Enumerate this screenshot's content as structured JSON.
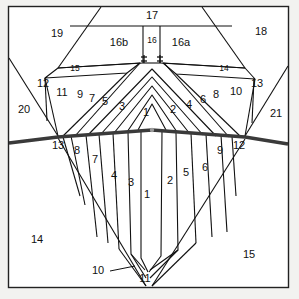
{
  "figure": {
    "type": "cross-section-diagram",
    "background_color": "#f2f2f0",
    "panel_fill": "#ffffff",
    "line_color": "#111111",
    "unconformity_color": "#3a3a3a",
    "frame": {
      "x": 8,
      "y": 6,
      "width": 281,
      "height": 282
    }
  },
  "labels": {
    "upper_fan": [
      {
        "id": "u1",
        "text": "1",
        "x": 146,
        "y": 113
      },
      {
        "id": "u2",
        "text": "2",
        "x": 173,
        "y": 110
      },
      {
        "id": "u3",
        "text": "3",
        "x": 122,
        "y": 107
      },
      {
        "id": "u4",
        "text": "4",
        "x": 189,
        "y": 105
      },
      {
        "id": "u5",
        "text": "5",
        "x": 105,
        "y": 102
      },
      {
        "id": "u6",
        "text": "6",
        "x": 203,
        "y": 100
      },
      {
        "id": "u7",
        "text": "7",
        "x": 92,
        "y": 99
      },
      {
        "id": "u8",
        "text": "8",
        "x": 216,
        "y": 95
      },
      {
        "id": "u9",
        "text": "9",
        "x": 80,
        "y": 95
      },
      {
        "id": "u10",
        "text": "10",
        "x": 236,
        "y": 92
      },
      {
        "id": "u11",
        "text": "11",
        "x": 62,
        "y": 93
      },
      {
        "id": "u12",
        "text": "12",
        "x": 43,
        "y": 84
      },
      {
        "id": "u13",
        "text": "13",
        "x": 257,
        "y": 84
      },
      {
        "id": "u14",
        "text": "14",
        "x": 224,
        "y": 69
      },
      {
        "id": "u15",
        "text": "15",
        "x": 75,
        "y": 69
      }
    ],
    "lower_fan": [
      {
        "id": "l1",
        "text": "1",
        "x": 147,
        "y": 195
      },
      {
        "id": "l2",
        "text": "2",
        "x": 170,
        "y": 181
      },
      {
        "id": "l3",
        "text": "3",
        "x": 131,
        "y": 183
      },
      {
        "id": "l4",
        "text": "4",
        "x": 114,
        "y": 176
      },
      {
        "id": "l5",
        "text": "5",
        "x": 186,
        "y": 173
      },
      {
        "id": "l6",
        "text": "6",
        "x": 205,
        "y": 168
      },
      {
        "id": "l7",
        "text": "7",
        "x": 95,
        "y": 160
      },
      {
        "id": "l8",
        "text": "8",
        "x": 77,
        "y": 151
      },
      {
        "id": "l9",
        "text": "9",
        "x": 220,
        "y": 151
      },
      {
        "id": "l10",
        "text": "10",
        "x": 98,
        "y": 271
      },
      {
        "id": "l11",
        "text": "11",
        "x": 145,
        "y": 279
      },
      {
        "id": "l12",
        "text": "12",
        "x": 239,
        "y": 146
      },
      {
        "id": "l13",
        "text": "13",
        "x": 58,
        "y": 146
      }
    ],
    "blocks": [
      {
        "id": "b14",
        "text": "14",
        "x": 37,
        "y": 240
      },
      {
        "id": "b15",
        "text": "15",
        "x": 249,
        "y": 255
      },
      {
        "id": "b16a",
        "text": "16a",
        "x": 181,
        "y": 43
      },
      {
        "id": "b16b",
        "text": "16b",
        "x": 119,
        "y": 43
      },
      {
        "id": "b16",
        "text": "16",
        "x": 152,
        "y": 41
      },
      {
        "id": "b17",
        "text": "17",
        "x": 152,
        "y": 16
      },
      {
        "id": "b18",
        "text": "18",
        "x": 261,
        "y": 32
      },
      {
        "id": "b19",
        "text": "19",
        "x": 57,
        "y": 34
      },
      {
        "id": "b20",
        "text": "20",
        "x": 24,
        "y": 110
      },
      {
        "id": "b21",
        "text": "21",
        "x": 276,
        "y": 114
      }
    ]
  },
  "geometry": {
    "unconformity_path": "M 9 142 L 58 136 L 152 130 L 245 136 L 288 143",
    "upper_left_flank": "M 9 58 L 58 136",
    "upper_right_flank": "M 288 66 L 245 136",
    "graben_left": "M 101 7 L 58 68",
    "graben_right": "M 202 7 L 245 68",
    "layer_17_base": "M 70 26 L 232 26",
    "strip16_left": "M 143 26 L 143 62",
    "strip16_right": "M 160 26 L 160 62",
    "sliver15": "M 46 76 L 58 68 L 145 63 L 132 71 Z",
    "sliver14": "M 256 78 L 245 68 L 158 63 L 171 72 Z",
    "lower_vee_left": "M 58 138 L 144 285",
    "lower_vee_right": "M 245 139 L 153 285",
    "post_12_left": "M 45 77 L 47 120",
    "post_13_right": "M 254 78 L 252 122"
  }
}
